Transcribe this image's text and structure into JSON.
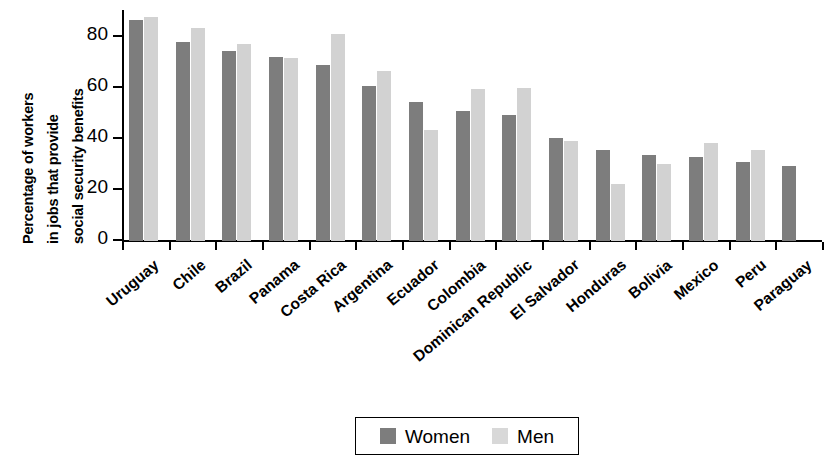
{
  "chart_data": {
    "type": "bar",
    "title": "",
    "subtitle": "",
    "xlabel": "",
    "ylabel": "Percentage of workers in jobs that provide social security benefits",
    "ylabel_lines": [
      "Percentage of workers",
      "in jobs that provide",
      "social security benefits"
    ],
    "ylim": [
      0,
      90
    ],
    "yticks": [
      0,
      20,
      40,
      60,
      80
    ],
    "ytick_labels": [
      "0",
      "20",
      "40",
      "60",
      "80"
    ],
    "grid": false,
    "legend_position": "bottom",
    "categories": [
      "Uruguay",
      "Chile",
      "Brazil",
      "Panama",
      "Costa Rica",
      "Argentina",
      "Ecuador",
      "Colombia",
      "Dominican Republic",
      "El Salvador",
      "Honduras",
      "Bolivia",
      "Mexico",
      "Peru",
      "Paraguay"
    ],
    "series": [
      {
        "name": "Women",
        "color": "#7d7d7d",
        "values": [
          86.5,
          78,
          74.5,
          72,
          69,
          60.5,
          54.5,
          51,
          49.5,
          40.5,
          35.5,
          33.5,
          33,
          31,
          29.5
        ]
      },
      {
        "name": "Men",
        "color": "#d2d2d2",
        "values": [
          87.5,
          83.5,
          77,
          71.5,
          81,
          66.5,
          43.5,
          59.5,
          60,
          39,
          22.5,
          30,
          38.5,
          35.5,
          0
        ]
      }
    ]
  },
  "legend": {
    "items": [
      {
        "label": "Women",
        "swatch": "women"
      },
      {
        "label": "Men",
        "swatch": "men"
      }
    ]
  }
}
